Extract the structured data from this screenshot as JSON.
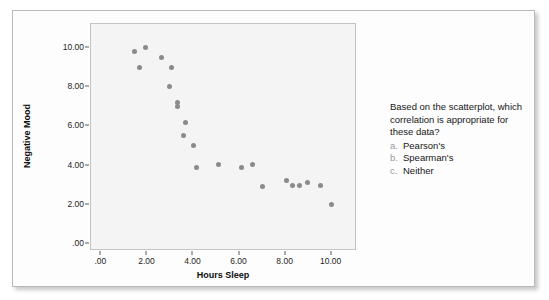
{
  "chart_data": {
    "type": "scatter",
    "title": "",
    "xlabel": "Hours Sleep",
    "ylabel": "Negative Mood",
    "xlim": [
      -0.45,
      11.1
    ],
    "ylim": [
      -0.35,
      11.2
    ],
    "xticks": [
      0,
      2,
      4,
      6,
      8,
      10
    ],
    "xticklabels": [
      ".00",
      "2.00",
      "4.00",
      "6.00",
      "8.00",
      "10.00"
    ],
    "yticks": [
      0,
      2,
      4,
      6,
      8,
      10
    ],
    "yticklabels": [
      ".00",
      "2.00",
      "4.00",
      "6.00",
      "8.00",
      "10.00"
    ],
    "grid": false,
    "legend": null,
    "marker_color": "#8a8a8a",
    "plot_background": "#f4f4f4",
    "points": [
      {
        "x": 1.45,
        "y": 9.8
      },
      {
        "x": 1.9,
        "y": 10.0
      },
      {
        "x": 1.65,
        "y": 9.0
      },
      {
        "x": 2.6,
        "y": 9.5
      },
      {
        "x": 3.05,
        "y": 9.0
      },
      {
        "x": 2.95,
        "y": 8.0
      },
      {
        "x": 3.3,
        "y": 7.2
      },
      {
        "x": 3.3,
        "y": 7.0
      },
      {
        "x": 3.65,
        "y": 6.2
      },
      {
        "x": 3.55,
        "y": 5.55
      },
      {
        "x": 4.0,
        "y": 5.0
      },
      {
        "x": 4.15,
        "y": 3.9
      },
      {
        "x": 5.1,
        "y": 4.05
      },
      {
        "x": 6.1,
        "y": 3.9
      },
      {
        "x": 6.55,
        "y": 4.05
      },
      {
        "x": 7.0,
        "y": 2.95
      },
      {
        "x": 8.05,
        "y": 3.25
      },
      {
        "x": 8.3,
        "y": 3.0
      },
      {
        "x": 8.6,
        "y": 3.0
      },
      {
        "x": 8.95,
        "y": 3.15
      },
      {
        "x": 9.5,
        "y": 3.0
      },
      {
        "x": 10.0,
        "y": 2.0
      }
    ]
  },
  "question": {
    "text": "Based on the scatterplot, which correlation is appropriate for these data?",
    "options": [
      {
        "letter": "a.",
        "label": "Pearson's"
      },
      {
        "letter": "b.",
        "label": "Spearman's"
      },
      {
        "letter": "c.",
        "label": "Neither"
      }
    ]
  }
}
